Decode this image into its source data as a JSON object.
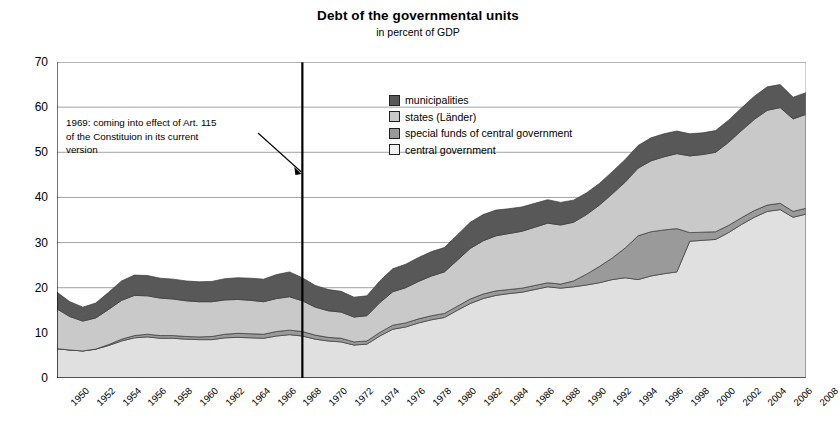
{
  "chart_data": {
    "type": "area",
    "title": "Debt of the governmental units",
    "subtitle": "in percent of GDP",
    "xlabel": "",
    "ylabel": "",
    "ylim": [
      0,
      70
    ],
    "ytick_step": 10,
    "yticks": [
      0,
      10,
      20,
      30,
      40,
      50,
      60,
      70
    ],
    "grid": true,
    "stacked": true,
    "legend_position": "inside-top-center",
    "x": [
      1950,
      1951,
      1952,
      1953,
      1954,
      1955,
      1956,
      1957,
      1958,
      1959,
      1960,
      1961,
      1962,
      1963,
      1964,
      1965,
      1966,
      1967,
      1968,
      1969,
      1970,
      1971,
      1972,
      1973,
      1974,
      1975,
      1976,
      1977,
      1978,
      1979,
      1980,
      1981,
      1982,
      1983,
      1984,
      1985,
      1986,
      1987,
      1988,
      1989,
      1990,
      1991,
      1992,
      1993,
      1994,
      1995,
      1996,
      1997,
      1998,
      1999,
      2000,
      2001,
      2002,
      2003,
      2004,
      2005,
      2006,
      2007,
      2008
    ],
    "xtick_labels": [
      1950,
      1952,
      1954,
      1956,
      1958,
      1960,
      1962,
      1964,
      1966,
      1968,
      1970,
      1972,
      1974,
      1976,
      1978,
      1980,
      1982,
      1984,
      1986,
      1988,
      1990,
      1992,
      1994,
      1996,
      1998,
      2000,
      2002,
      2004,
      2006,
      2008
    ],
    "series": [
      {
        "name": "central government",
        "color": "#e0e0e0",
        "order": 1,
        "values": [
          6.5,
          6.2,
          6.0,
          6.4,
          7.2,
          8.2,
          8.9,
          9.1,
          8.8,
          8.8,
          8.6,
          8.5,
          8.5,
          8.9,
          9.0,
          8.9,
          8.8,
          9.3,
          9.6,
          9.3,
          8.6,
          8.2,
          8.0,
          7.3,
          7.5,
          9.3,
          10.8,
          11.3,
          12.2,
          12.9,
          13.4,
          15.0,
          16.5,
          17.6,
          18.3,
          18.7,
          19.0,
          19.6,
          20.2,
          19.9,
          20.2,
          20.6,
          21.1,
          21.8,
          22.2,
          21.8,
          22.6,
          23.1,
          23.5,
          30.3,
          30.5,
          30.7,
          32.2,
          34.0,
          35.6,
          36.9,
          37.3,
          35.6,
          36.3
        ]
      },
      {
        "name": "special funds of central government",
        "color": "#9a9a9a",
        "order": 2,
        "values": [
          0.0,
          0.0,
          0.0,
          0.0,
          0.2,
          0.4,
          0.5,
          0.6,
          0.6,
          0.6,
          0.6,
          0.6,
          0.7,
          0.8,
          0.9,
          0.9,
          0.9,
          1.0,
          1.0,
          1.0,
          0.9,
          0.8,
          0.8,
          0.7,
          0.7,
          0.8,
          0.9,
          0.9,
          0.9,
          0.9,
          0.9,
          0.9,
          1.0,
          1.0,
          1.0,
          0.9,
          0.9,
          0.9,
          0.9,
          0.9,
          1.3,
          2.4,
          3.6,
          4.8,
          6.6,
          9.7,
          9.8,
          9.7,
          9.6,
          1.9,
          1.8,
          1.7,
          1.6,
          1.5,
          1.5,
          1.4,
          1.4,
          1.3,
          1.3
        ]
      },
      {
        "name": "states (Länder)",
        "color": "#c9c9c9",
        "order": 3,
        "values": [
          8.8,
          7.4,
          6.6,
          6.9,
          7.8,
          8.6,
          8.9,
          8.5,
          8.3,
          8.1,
          7.9,
          7.8,
          7.7,
          7.6,
          7.5,
          7.4,
          7.2,
          7.3,
          7.4,
          6.8,
          6.2,
          5.9,
          5.8,
          5.5,
          5.6,
          6.6,
          7.4,
          7.8,
          8.3,
          8.8,
          9.2,
          10.2,
          11.2,
          11.8,
          12.2,
          12.4,
          12.6,
          12.9,
          13.2,
          13.1,
          13.0,
          13.2,
          13.6,
          14.2,
          14.6,
          15.0,
          15.7,
          16.2,
          16.6,
          17.0,
          17.2,
          17.6,
          18.4,
          19.3,
          20.2,
          21.0,
          21.2,
          20.5,
          20.8
        ]
      },
      {
        "name": "municipalities",
        "color": "#585858",
        "order": 4,
        "values": [
          3.7,
          3.3,
          3.1,
          3.3,
          3.8,
          4.3,
          4.5,
          4.5,
          4.4,
          4.4,
          4.4,
          4.4,
          4.5,
          4.7,
          4.8,
          4.9,
          5.0,
          5.3,
          5.5,
          5.1,
          4.8,
          4.7,
          4.6,
          4.4,
          4.4,
          4.8,
          5.1,
          5.2,
          5.3,
          5.4,
          5.4,
          5.6,
          5.8,
          5.8,
          5.7,
          5.5,
          5.4,
          5.3,
          5.2,
          5.0,
          4.9,
          4.8,
          4.8,
          4.9,
          5.0,
          5.0,
          5.1,
          5.1,
          5.0,
          4.9,
          4.8,
          4.8,
          4.9,
          5.0,
          5.1,
          5.2,
          5.1,
          4.8,
          4.8
        ]
      }
    ],
    "totals": [
      19.0,
      16.9,
      15.7,
      16.6,
      19.0,
      21.5,
      22.8,
      22.7,
      22.1,
      21.9,
      21.5,
      21.3,
      21.4,
      22.0,
      22.2,
      22.1,
      21.9,
      22.9,
      23.5,
      22.2,
      20.5,
      19.6,
      19.2,
      17.9,
      18.2,
      21.5,
      24.2,
      25.2,
      26.7,
      28.0,
      28.9,
      31.7,
      34.5,
      36.2,
      37.2,
      37.5,
      37.9,
      38.7,
      39.5,
      38.9,
      39.4,
      41.0,
      43.1,
      45.7,
      48.4,
      51.5,
      53.2,
      54.1,
      54.7,
      54.1,
      54.3,
      54.8,
      57.1,
      59.8,
      62.4,
      64.5,
      65.0,
      62.2,
      63.2
    ],
    "annotation": {
      "text": "1969: coming into effect of Art. 115 of the Constituion in its current version",
      "lines": [
        "1969: coming into effect of Art. 115",
        "of the Constituion in its current",
        "version"
      ],
      "marker_year": 1969,
      "marker_type": "vertical-line",
      "marker_color": "#000000"
    }
  },
  "legend": {
    "items": [
      {
        "label": "municipalities",
        "color": "#585858"
      },
      {
        "label": "states (Länder)",
        "color": "#c9c9c9"
      },
      {
        "label": "special funds of central government",
        "color": "#9a9a9a"
      },
      {
        "label": "central government",
        "color": "#f2f2f2"
      }
    ]
  },
  "axis": {
    "y_ticks": [
      "70",
      "60",
      "50",
      "40",
      "30",
      "20",
      "10",
      "0"
    ]
  }
}
